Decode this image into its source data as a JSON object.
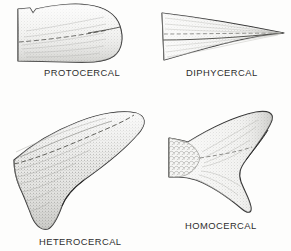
{
  "figure": {
    "style": "pen-and-ink stipple line drawing",
    "background_color": "#fdfdfc",
    "ink_color": "#2a2a2a",
    "fill_color": "#efefed",
    "layout": "2x2 grid of labeled specimens"
  },
  "panels": [
    {
      "id": "protocercal",
      "label": "PROTOCERCAL",
      "row": 1,
      "column": 1,
      "description": "Primitive rounded paddle-like tail, symmetrical about the notochord, with a small dorsal notch near the body",
      "label_position": {
        "x": 44,
        "y": 68
      }
    },
    {
      "id": "diphycercal",
      "label": "DIPHYCERCAL",
      "row": 1,
      "column": 2,
      "description": "Symmetrical tail tapering to a single sharp posterior point, vertebral column running straight to the tip",
      "label_position": {
        "x": 186,
        "y": 68
      }
    },
    {
      "id": "heterocercal",
      "label": "HETEROCERCAL",
      "row": 2,
      "column": 1,
      "description": "Asymmetrical tail with a long upturned upper lobe containing the vertebral column and a smaller ventral lobe",
      "label_position": {
        "x": 39,
        "y": 237
      }
    },
    {
      "id": "homocercal",
      "label": "HOMOCERCAL",
      "row": 2,
      "column": 2,
      "description": "Externally symmetrical deeply forked tail with two equal lobes and a scaled caudal peduncle",
      "label_position": {
        "x": 185,
        "y": 221
      }
    }
  ]
}
